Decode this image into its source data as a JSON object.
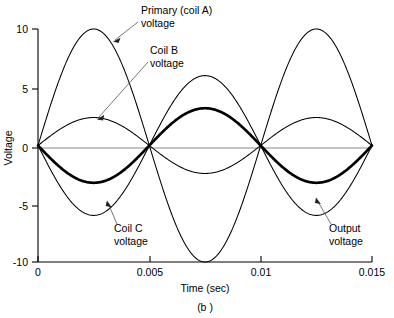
{
  "figure": {
    "caption": "(b )",
    "panel_label": "(b )"
  },
  "chart_data": {
    "type": "line",
    "title": "",
    "xlabel": "Time (sec)",
    "ylabel": "Voltage",
    "xlim": [
      0,
      0.015
    ],
    "ylim": [
      -10,
      10
    ],
    "xticks": [
      0,
      0.005,
      0.01,
      0.015
    ],
    "xtick_labels": [
      "0",
      "0.005",
      "0.01",
      "0.015"
    ],
    "yticks": [
      10,
      5,
      0,
      -5,
      -10
    ],
    "ytick_labels": [
      "10",
      "5",
      "0",
      "-5",
      "-10"
    ],
    "grid": false,
    "legend": "annotations",
    "x_unit": "sec",
    "y_unit": "V",
    "period_sec": 0.01,
    "series": [
      {
        "name": "Primary (coil A) voltage",
        "amplitude": 10,
        "phase_deg": 0,
        "style": "thin",
        "peaks": [
          {
            "t": 0.0025,
            "v": 10
          },
          {
            "t": 0.0075,
            "v": -10
          },
          {
            "t": 0.0125,
            "v": 10
          }
        ],
        "zeros": [
          0,
          0.005,
          0.01,
          0.015
        ],
        "value_at_end": 2.6
      },
      {
        "name": "Coil B voltage",
        "amplitude": 2.4,
        "phase_deg": 0,
        "style": "thin",
        "peaks": [
          {
            "t": 0.0025,
            "v": 2.4
          },
          {
            "t": 0.0075,
            "v": -2.4
          },
          {
            "t": 0.0125,
            "v": 2.2
          }
        ],
        "zeros": [
          0,
          0.005,
          0.01,
          0.015
        ],
        "value_at_end": 0.6
      },
      {
        "name": "Coil C voltage",
        "amplitude": 6,
        "phase_deg": 180,
        "style": "thin",
        "peaks": [
          {
            "t": 0.0025,
            "v": -6
          },
          {
            "t": 0.0075,
            "v": 6
          },
          {
            "t": 0.0125,
            "v": -6
          }
        ],
        "zeros": [
          0,
          0.005,
          0.01,
          0.015
        ],
        "value_at_end": -1.6
      },
      {
        "name": "Output voltage",
        "amplitude": 3.2,
        "phase_deg": 180,
        "style": "bold",
        "peaks": [
          {
            "t": 0.0025,
            "v": -3.2
          },
          {
            "t": 0.0075,
            "v": 3.2
          },
          {
            "t": 0.0125,
            "v": -3.2
          }
        ],
        "zeros": [
          0,
          0.005,
          0.01,
          0.015
        ],
        "value_at_end": -0.9
      }
    ],
    "annotations": [
      {
        "id": "primary",
        "label_line1": "Primary (coil A)",
        "label_line2": "voltage",
        "points_to": {
          "t": 0.0031,
          "v": 9.1
        }
      },
      {
        "id": "coil-b",
        "label_line1": "Coil B",
        "label_line2": "voltage",
        "points_to": {
          "t": 0.00215,
          "v": 2.35
        }
      },
      {
        "id": "coil-c",
        "label_line1": "Coil C",
        "label_line2": "voltage",
        "points_to": {
          "t": 0.00325,
          "v": -5.1
        }
      },
      {
        "id": "output",
        "label_line1": "Output",
        "label_line2": "voltage",
        "points_to": {
          "t": 0.01305,
          "v": -3.1
        }
      }
    ]
  },
  "colors": {
    "curve": "#000000",
    "axis": "#000000",
    "zero_line": "#8c8c8c",
    "leader": "#555555",
    "background": "#ffffff"
  }
}
